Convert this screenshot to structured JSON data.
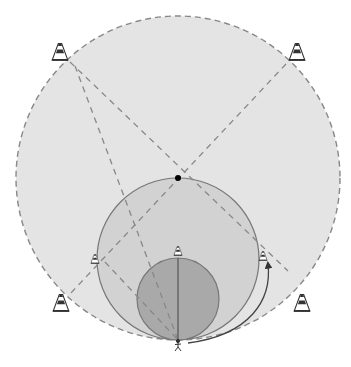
{
  "diagram": {
    "type": "sports-drill-field-diagram",
    "colors": {
      "background": "#ffffff",
      "outer_circle_fill": "#e4e4e4",
      "middle_circle_fill": "#d2d2d2",
      "inner_circle_fill": "#a9a9a9",
      "outline": "#777777",
      "dash": "#888888",
      "cone_dark": "#333333",
      "dot": "#000000"
    },
    "circles": [
      {
        "id": "outer",
        "cx": 178,
        "cy": 178,
        "r": 162,
        "style": "dashed"
      },
      {
        "id": "middle",
        "cx": 178,
        "cy": 259,
        "r": 81,
        "style": "solid"
      },
      {
        "id": "inner",
        "cx": 178,
        "cy": 299,
        "r": 41,
        "style": "solid"
      }
    ],
    "center_point": {
      "x": 178,
      "y": 178
    },
    "cones": [
      {
        "id": "cone-top-left",
        "x": 60,
        "y": 52,
        "size": "large"
      },
      {
        "id": "cone-top-right",
        "x": 297,
        "y": 52,
        "size": "large"
      },
      {
        "id": "cone-bottom-left",
        "x": 61,
        "y": 303,
        "size": "large"
      },
      {
        "id": "cone-bottom-right",
        "x": 302,
        "y": 303,
        "size": "large"
      },
      {
        "id": "cone-mid-left",
        "x": 95,
        "y": 259,
        "size": "small"
      },
      {
        "id": "cone-mid-right",
        "x": 263,
        "y": 256,
        "size": "small"
      },
      {
        "id": "cone-center",
        "x": 178,
        "y": 251,
        "size": "small"
      }
    ],
    "player": {
      "x": 178,
      "y": 346,
      "label": "player-icon"
    },
    "dashed_lines": [
      {
        "x1": 70,
        "y1": 62,
        "x2": 288,
        "y2": 271
      },
      {
        "x1": 75,
        "y1": 66,
        "x2": 178,
        "y2": 340
      },
      {
        "x1": 286,
        "y1": 64,
        "x2": 70,
        "y2": 294
      },
      {
        "x1": 105,
        "y1": 262,
        "x2": 178,
        "y2": 340
      }
    ],
    "solid_lines": [
      {
        "x1": 178,
        "y1": 258,
        "x2": 178,
        "y2": 340
      }
    ],
    "run_arrow": {
      "path": "M188,343 C250,335 272,300 268,264",
      "head": {
        "x": 268,
        "y": 264
      }
    }
  }
}
